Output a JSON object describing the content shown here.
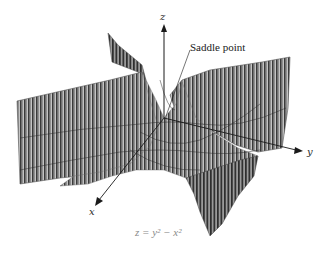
{
  "figure": {
    "equation": "z = y² − x²",
    "callout": "Saddle point",
    "axes": {
      "x": "x",
      "y": "y",
      "z": "z"
    },
    "colors": {
      "surface_fill": "#b8b8b8",
      "surface_stripe": "#3c3c3c",
      "axis": "#1a1a1a",
      "formula": "#8a8a8a"
    }
  }
}
